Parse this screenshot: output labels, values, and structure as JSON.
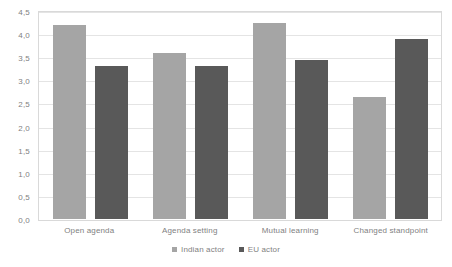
{
  "chart_data": {
    "type": "bar",
    "title": "",
    "subtitle": "",
    "xlabel": "",
    "ylabel": "",
    "categories": [
      "Open agenda",
      "Agenda setting",
      "Mutual learning",
      "Changed standpoint"
    ],
    "series": [
      {
        "name": "Indian actor",
        "color": "#a5a5a5",
        "values": [
          4.2,
          3.6,
          4.25,
          2.65
        ]
      },
      {
        "name": "EU actor",
        "color": "#595959",
        "values": [
          3.3,
          3.3,
          3.45,
          3.9
        ]
      }
    ],
    "ylim": [
      0,
      4.5
    ],
    "ytick_step": 0.5,
    "ytick_labels": [
      "4,5",
      "4,0",
      "3,5",
      "3,0",
      "2,5",
      "2,0",
      "1,5",
      "1,0",
      "0,5",
      "0,0"
    ],
    "ytick_values": [
      4.5,
      4.0,
      3.5,
      3.0,
      2.5,
      2.0,
      1.5,
      1.0,
      0.5,
      0.0
    ],
    "decimal_separator": ",",
    "grid": true,
    "grid_axis": "y",
    "grid_color": "#e4e4e4",
    "plot_border_color": "#d9d9d9",
    "legend_position": "bottom",
    "background_color": "#ffffff",
    "text_color": "#7f7f7f",
    "annotations": []
  }
}
